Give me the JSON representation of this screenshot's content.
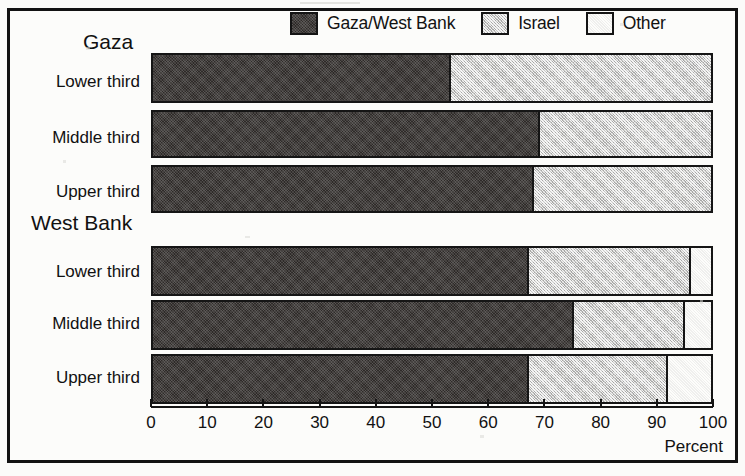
{
  "legend": {
    "items": [
      {
        "label": "Gaza/West Bank",
        "swatch": "dark-swatch",
        "color": "#2e2a28"
      },
      {
        "label": "Israel",
        "swatch": "mid-swatch",
        "color": "#c9c9c7"
      },
      {
        "label": "Other",
        "swatch": "light-swatch",
        "color": "#ffffff"
      }
    ]
  },
  "axis": {
    "caption": "Percent",
    "ticks": [
      "0",
      "10",
      "20",
      "30",
      "40",
      "50",
      "60",
      "70",
      "80",
      "90",
      "100"
    ],
    "min": 0,
    "max": 100
  },
  "groups": [
    {
      "title": "Gaza"
    },
    {
      "title": "West Bank"
    }
  ],
  "rows": [
    {
      "label": "Lower third"
    },
    {
      "label": "Middle third"
    },
    {
      "label": "Upper third"
    },
    {
      "label": "Lower third"
    },
    {
      "label": "Middle third"
    },
    {
      "label": "Upper third"
    }
  ],
  "chart_data": {
    "type": "bar",
    "orientation": "horizontal",
    "stacked": true,
    "title": "",
    "xlabel": "Percent",
    "ylabel": "",
    "xlim": [
      0,
      100
    ],
    "grid": false,
    "legend_position": "top",
    "groups": [
      "Gaza",
      "West Bank"
    ],
    "categories": [
      "Gaza - Lower third",
      "Gaza - Middle third",
      "Gaza - Upper third",
      "West Bank - Lower third",
      "West Bank - Middle third",
      "West Bank - Upper third"
    ],
    "series": [
      {
        "name": "Gaza/West Bank",
        "values": [
          53,
          69,
          68,
          67,
          75,
          67
        ]
      },
      {
        "name": "Israel",
        "values": [
          47,
          31,
          32,
          29,
          20,
          25
        ]
      },
      {
        "name": "Other",
        "values": [
          0,
          0,
          0,
          4,
          5,
          8
        ]
      }
    ]
  }
}
